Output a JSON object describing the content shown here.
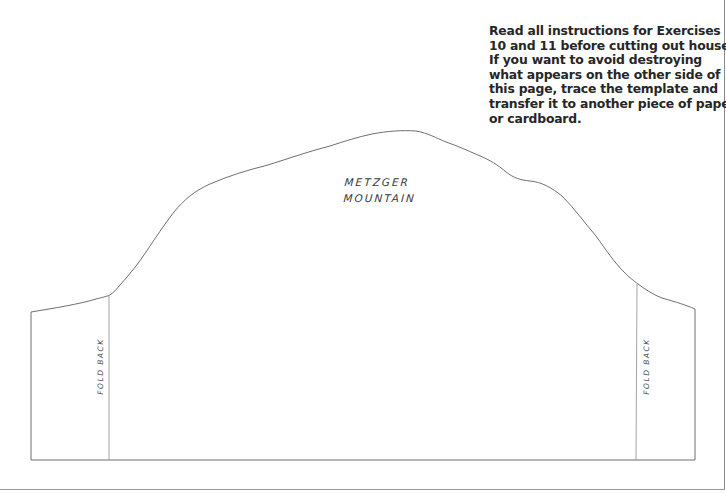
{
  "instructions": {
    "lines": [
      "Read all instructions for Exercises",
      "10 and 11 before cutting out house.",
      "If you want to avoid destroying",
      "what appears on the other side of",
      "this page, trace the template and",
      "transfer it to another piece of paper",
      "or cardboard."
    ]
  },
  "template": {
    "title_line1": "METZGER",
    "title_line2": "MOUNTAIN",
    "fold_left_label": "FOLD  BACK",
    "fold_right_label": "FOLD  BACK",
    "colors": {
      "line": "#6f6f6f",
      "fold_line": "#9a9a9a",
      "text": "#262626"
    }
  }
}
